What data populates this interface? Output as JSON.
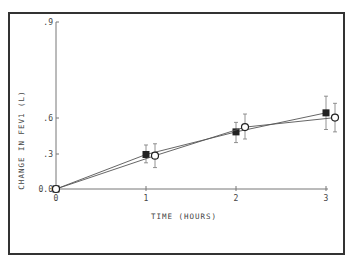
{
  "chart_data": {
    "type": "line",
    "title": "",
    "xlabel": "TIME (HOURS)",
    "ylabel": "CHANGE IN FEV1 (L)",
    "x_ticks": [
      "0",
      "1",
      "2",
      "3"
    ],
    "y_ticks": [
      "0.0",
      ".3",
      ".6",
      ".9"
    ],
    "xlim": [
      0,
      3
    ],
    "ylim": [
      0,
      0.9
    ],
    "grid": false,
    "legend": "none",
    "series": [
      {
        "name": "Filled squares",
        "marker": "filled-square",
        "x": [
          0,
          1,
          2,
          3
        ],
        "y": [
          0.0,
          0.29,
          0.48,
          0.64
        ],
        "err_low": [
          0.0,
          0.22,
          0.39,
          0.5
        ],
        "err_high": [
          0.0,
          0.37,
          0.56,
          0.78
        ]
      },
      {
        "name": "Open circles",
        "marker": "open-circle",
        "x": [
          0,
          1.1,
          2.1,
          3.1
        ],
        "y": [
          0.0,
          0.28,
          0.52,
          0.6
        ],
        "err_low": [
          0.0,
          0.18,
          0.42,
          0.48
        ],
        "err_high": [
          0.0,
          0.38,
          0.63,
          0.72
        ]
      }
    ]
  }
}
